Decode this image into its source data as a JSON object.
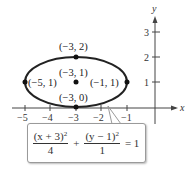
{
  "figure": {
    "axes": {
      "x_label": "x",
      "y_label": "y",
      "x_ticks": [
        "−5",
        "−4",
        "−3",
        "−2",
        "−1"
      ],
      "y_ticks": [
        "1",
        "2",
        "3"
      ]
    },
    "points": [
      {
        "label": "(−3, 2)"
      },
      {
        "label": "(−3, 1)"
      },
      {
        "label": "(−5, 1)"
      },
      {
        "label": "(−1, 1)"
      },
      {
        "label": "(−3, 0)"
      }
    ],
    "equation": {
      "num1": "(x + 3)",
      "den1": "4",
      "plus": "+",
      "num2": "(y − 1)",
      "den2": "1",
      "exp": "2",
      "rhs": "= 1"
    }
  }
}
